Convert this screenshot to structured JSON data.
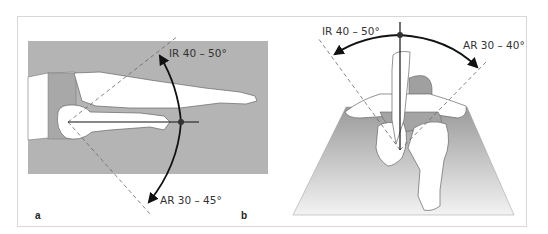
{
  "figure": {
    "panels": [
      {
        "id": "a",
        "letter": "a",
        "view": "prone, lateral/top view, knee flexed",
        "labels": {
          "internal_rotation": "IR 40 – 50°",
          "external_rotation": "AR 30 – 45°"
        }
      },
      {
        "id": "b",
        "letter": "b",
        "view": "prone, viewed from feet, knee flexed 90°",
        "labels": {
          "internal_rotation": "IR 40 – 50°",
          "external_rotation": "AR 30 – 40°"
        }
      }
    ],
    "colors": {
      "background": "#ffffff",
      "frame": "#d8d8d8",
      "table_gray": "#b4b4b4",
      "body_fill": "#ffffff",
      "outline": "#555555",
      "arc": "#111111",
      "dashed": "#666666",
      "floor_top": "#9a9a9a",
      "floor_bottom": "#f2f2f2"
    }
  }
}
